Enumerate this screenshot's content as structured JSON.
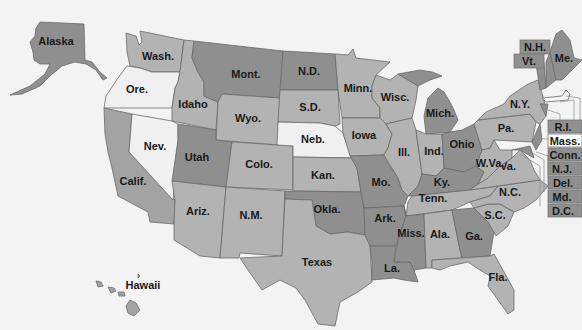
{
  "colors": {
    "background": "#f3f3f3",
    "light": "#f0f0f0",
    "medium_light": "#b3b3b3",
    "medium": "#a3a3a3",
    "dark": "#8f8f8f",
    "label": "#1a1a1a"
  },
  "states": [
    {
      "id": "alaska",
      "label": "Alaska",
      "shade": "dark"
    },
    {
      "id": "hawaii",
      "label": "Hawaii",
      "shade": "medium"
    },
    {
      "id": "washington",
      "label": "Wash.",
      "shade": "medium_light"
    },
    {
      "id": "oregon",
      "label": "Ore.",
      "shade": "light"
    },
    {
      "id": "california",
      "label": "Calif.",
      "shade": "medium"
    },
    {
      "id": "nevada",
      "label": "Nev.",
      "shade": "light"
    },
    {
      "id": "idaho",
      "label": "Idaho",
      "shade": "medium_light"
    },
    {
      "id": "montana",
      "label": "Mont.",
      "shade": "dark"
    },
    {
      "id": "wyoming",
      "label": "Wyo.",
      "shade": "medium_light"
    },
    {
      "id": "utah",
      "label": "Utah",
      "shade": "dark"
    },
    {
      "id": "arizona",
      "label": "Ariz.",
      "shade": "medium_light"
    },
    {
      "id": "colorado",
      "label": "Colo.",
      "shade": "medium_light"
    },
    {
      "id": "new_mexico",
      "label": "N.M.",
      "shade": "medium_light"
    },
    {
      "id": "north_dakota",
      "label": "N.D.",
      "shade": "dark"
    },
    {
      "id": "south_dakota",
      "label": "S.D.",
      "shade": "medium_light"
    },
    {
      "id": "nebraska",
      "label": "Neb.",
      "shade": "light"
    },
    {
      "id": "kansas",
      "label": "Kan.",
      "shade": "medium_light"
    },
    {
      "id": "oklahoma",
      "label": "Okla.",
      "shade": "dark"
    },
    {
      "id": "texas",
      "label": "Texas",
      "shade": "medium_light"
    },
    {
      "id": "minnesota",
      "label": "Minn.",
      "shade": "medium_light"
    },
    {
      "id": "iowa",
      "label": "Iowa",
      "shade": "medium_light"
    },
    {
      "id": "missouri",
      "label": "Mo.",
      "shade": "dark"
    },
    {
      "id": "arkansas",
      "label": "Ark.",
      "shade": "dark"
    },
    {
      "id": "louisiana",
      "label": "La.",
      "shade": "dark"
    },
    {
      "id": "wisconsin",
      "label": "Wisc.",
      "shade": "medium_light"
    },
    {
      "id": "illinois",
      "label": "Ill.",
      "shade": "medium_light"
    },
    {
      "id": "michigan",
      "label": "Mich.",
      "shade": "dark"
    },
    {
      "id": "indiana",
      "label": "Ind.",
      "shade": "medium_light"
    },
    {
      "id": "ohio",
      "label": "Ohio",
      "shade": "dark"
    },
    {
      "id": "kentucky",
      "label": "Ky.",
      "shade": "dark"
    },
    {
      "id": "tennessee",
      "label": "Tenn.",
      "shade": "medium_light"
    },
    {
      "id": "mississippi",
      "label": "Miss.",
      "shade": "dark"
    },
    {
      "id": "alabama",
      "label": "Ala.",
      "shade": "medium_light"
    },
    {
      "id": "georgia",
      "label": "Ga.",
      "shade": "dark"
    },
    {
      "id": "florida",
      "label": "Fla.",
      "shade": "medium_light"
    },
    {
      "id": "south_carolina",
      "label": "S.C.",
      "shade": "medium_light"
    },
    {
      "id": "north_carolina",
      "label": "N.C.",
      "shade": "medium_light"
    },
    {
      "id": "virginia",
      "label": "Va.",
      "shade": "medium_light"
    },
    {
      "id": "west_virginia",
      "label": "W.Va.",
      "shade": "medium_light"
    },
    {
      "id": "pennsylvania",
      "label": "Pa.",
      "shade": "medium_light"
    },
    {
      "id": "new_york",
      "label": "N.Y.",
      "shade": "medium_light"
    },
    {
      "id": "maine",
      "label": "Me.",
      "shade": "dark"
    },
    {
      "id": "new_hampshire",
      "label": "N.H.",
      "shade": "dark"
    },
    {
      "id": "vermont",
      "label": "Vt.",
      "shade": "dark"
    }
  ],
  "callouts": [
    {
      "label": "N.H.",
      "shade": "dark"
    },
    {
      "label": "Vt.",
      "shade": "dark"
    },
    {
      "label": "R.I.",
      "shade": "dark"
    },
    {
      "label": "Mass.",
      "shade": "light"
    },
    {
      "label": "Conn.",
      "shade": "dark"
    },
    {
      "label": "N.J.",
      "shade": "dark"
    },
    {
      "label": "Del.",
      "shade": "dark"
    },
    {
      "label": "Md.",
      "shade": "dark"
    },
    {
      "label": "D.C.",
      "shade": "dark"
    }
  ]
}
